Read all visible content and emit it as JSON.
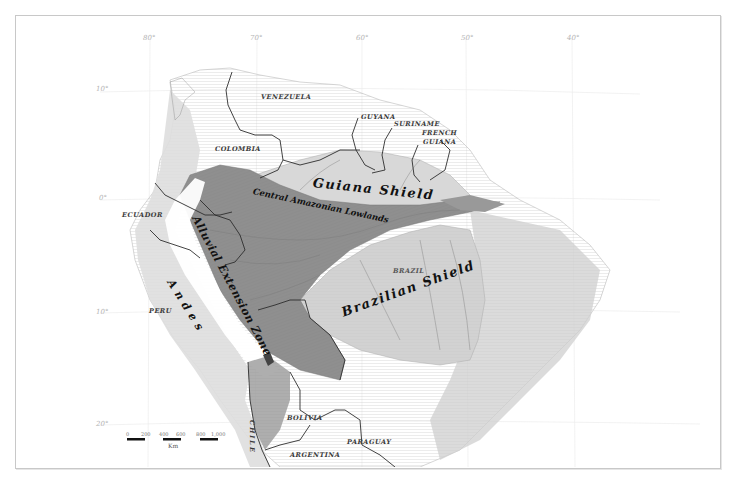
{
  "map": {
    "graticule": {
      "longitudes": [
        {
          "label": "80°",
          "x": 150
        },
        {
          "label": "70°",
          "x": 257
        },
        {
          "label": "60°",
          "x": 362
        },
        {
          "label": "50°",
          "x": 466
        },
        {
          "label": "40°",
          "x": 572
        }
      ],
      "latitudes": [
        {
          "label": "10°",
          "y": 90
        },
        {
          "label": "0°",
          "y": 199
        },
        {
          "label": "10°",
          "y": 313
        },
        {
          "label": "20°",
          "y": 425
        }
      ]
    },
    "countries": [
      {
        "name": "VENEZUELA",
        "x": 261,
        "y": 96
      },
      {
        "name": "GUYANA",
        "x": 361,
        "y": 116
      },
      {
        "name": "SURINAME",
        "x": 394,
        "y": 123
      },
      {
        "name": "FRENCH",
        "x": 422,
        "y": 132
      },
      {
        "name": "GUIANA",
        "x": 423,
        "y": 141
      },
      {
        "name": "COLOMBIA",
        "x": 215,
        "y": 148
      },
      {
        "name": "ECUADOR",
        "x": 122,
        "y": 214
      },
      {
        "name": "BRAZIL",
        "x": 393,
        "y": 270
      },
      {
        "name": "PERU",
        "x": 149,
        "y": 310
      },
      {
        "name": "BOLIVIA",
        "x": 287,
        "y": 417
      },
      {
        "name": "PARAGUAY",
        "x": 347,
        "y": 441
      },
      {
        "name": "ARGENTINA",
        "x": 290,
        "y": 454
      },
      {
        "name": "CHILE",
        "x": 260,
        "y": 412
      }
    ],
    "regions": [
      {
        "name": "Guiana Shield",
        "x": 313,
        "y": 181,
        "size": 13,
        "rotate": 6
      },
      {
        "name": "Central Amazonian Lowlands",
        "x": 253,
        "y": 190,
        "size": 8.5,
        "rotate": 12
      },
      {
        "name": "Alluvial Extension Zone",
        "x": 195,
        "y": 216,
        "size": 11,
        "rotate": 62
      },
      {
        "name": "Andes",
        "x": 170,
        "y": 280,
        "size": 11,
        "rotate": 58
      },
      {
        "name": "Brazilian Shield",
        "x": 342,
        "y": 306,
        "size": 13,
        "rotate": -20
      }
    ],
    "scale_bar": {
      "ticks": [
        "0",
        "200",
        "400",
        "600",
        "800",
        "1,000"
      ],
      "unit": "Km"
    },
    "colors": {
      "lowland": "#8f8f8f",
      "shield": "#d4d4d4",
      "andes_white": "#ffffff",
      "relief": "#c6c6c6",
      "border": "#2e2e2e",
      "river": "#7a7a7a"
    }
  }
}
